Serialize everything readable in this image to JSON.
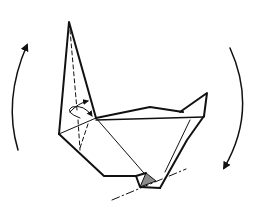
{
  "diagram": {
    "type": "origami-fold-instruction",
    "description": "Origami model with a tall pointed flap; arrows indicate rotating/turning the model over; dash-dot line marks a fold, shaded triangle marks the reverse-side paper",
    "colors": {
      "line": "#111111",
      "shade": "#8a8a8a",
      "background": "#ffffff"
    },
    "elements": {
      "left_arrow": "rotate-arrow-counterclockwise",
      "right_arrow": "rotate-arrow-clockwise",
      "spike_flap": "pointed-flap",
      "fold_arrow": "small-curved-fold-arrow",
      "sink_loop": "loop-arrow",
      "fold_line": "dash-dot-valley-line",
      "shaded_area": "colored-side-triangle"
    }
  }
}
